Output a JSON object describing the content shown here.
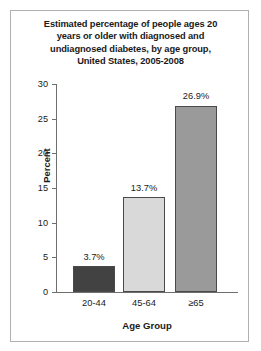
{
  "chart_data": {
    "type": "bar",
    "title": "Estimated percentage of people ages 20 years or older with diagnosed and undiagnosed diabetes, by age group, United States, 2005-2008",
    "title_lines": [
      "Estimated percentage of people ages 20",
      "years or older with diagnosed and",
      "undiagnosed diabetes, by age group,",
      "United States, 2005-2008"
    ],
    "categories": [
      "20-44",
      "45-64",
      "≥65"
    ],
    "values": [
      3.7,
      26.9,
      13.7
    ],
    "series": [
      {
        "name": "Percent with diabetes",
        "values": [
          3.7,
          13.7,
          26.9
        ]
      }
    ],
    "data_labels": [
      "3.7%",
      "13.7%",
      "26.9%"
    ],
    "xlabel": "Age Group",
    "ylabel": "Percent",
    "ylim": [
      0,
      30
    ],
    "yticks": [
      0,
      5,
      10,
      15,
      20,
      25,
      30
    ],
    "ytick_labels": [
      "0",
      "5",
      "10",
      "15",
      "20",
      "25",
      "30"
    ],
    "grid": false,
    "legend": false,
    "bar_colors": [
      "#424242",
      "#d9d9d9",
      "#9a9a9a"
    ],
    "bar_edge_color": "#4a4a4a",
    "axis_color": "#6e6e6e",
    "frame_color": "#b0b0b0",
    "background": "#ffffff",
    "text_color": "#1a1a1a"
  }
}
